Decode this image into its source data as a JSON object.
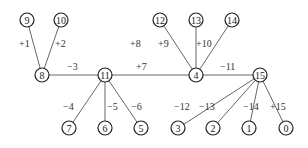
{
  "diagram": {
    "type": "tree",
    "nodes": [
      {
        "id": "9",
        "x": 27,
        "y": 20
      },
      {
        "id": "10",
        "x": 61,
        "y": 20
      },
      {
        "id": "12",
        "x": 160,
        "y": 20
      },
      {
        "id": "13",
        "x": 196,
        "y": 20
      },
      {
        "id": "14",
        "x": 232,
        "y": 20
      },
      {
        "id": "8",
        "x": 42,
        "y": 75
      },
      {
        "id": "11",
        "x": 105,
        "y": 75
      },
      {
        "id": "4",
        "x": 196,
        "y": 75
      },
      {
        "id": "15",
        "x": 260,
        "y": 75
      },
      {
        "id": "7",
        "x": 69,
        "y": 128
      },
      {
        "id": "6",
        "x": 105,
        "y": 128
      },
      {
        "id": "5",
        "x": 141,
        "y": 128
      },
      {
        "id": "3",
        "x": 178,
        "y": 128
      },
      {
        "id": "2",
        "x": 213,
        "y": 128
      },
      {
        "id": "1",
        "x": 249,
        "y": 128
      },
      {
        "id": "0",
        "x": 286,
        "y": 128
      }
    ],
    "edges": [
      {
        "from": "8",
        "to": "9",
        "label": "+1",
        "lx": 19,
        "ly": 47
      },
      {
        "from": "8",
        "to": "10",
        "label": "+2",
        "lx": 55,
        "ly": 47
      },
      {
        "from": "8",
        "to": "11",
        "label": "−3",
        "lx": 67,
        "ly": 70
      },
      {
        "from": "11",
        "to": "4",
        "label": "+7",
        "lx": 136,
        "ly": 70
      },
      {
        "from": "4",
        "to": "12",
        "label": "+8",
        "lx": 130,
        "ly": 47
      },
      {
        "from": "4",
        "to": "13",
        "label": "+9",
        "lx": 158,
        "ly": 47
      },
      {
        "from": "4",
        "to": "14",
        "label": "+10",
        "lx": 196,
        "ly": 47
      },
      {
        "from": "4",
        "to": "15",
        "label": "−11",
        "lx": 220,
        "ly": 70
      },
      {
        "from": "11",
        "to": "7",
        "label": "−4",
        "lx": 63,
        "ly": 110
      },
      {
        "from": "11",
        "to": "6",
        "label": "−5",
        "lx": 107,
        "ly": 110
      },
      {
        "from": "11",
        "to": "5",
        "label": "−6",
        "lx": 131,
        "ly": 110
      },
      {
        "from": "15",
        "to": "3",
        "label": "−12",
        "lx": 174,
        "ly": 110
      },
      {
        "from": "15",
        "to": "2",
        "label": "−13",
        "lx": 199,
        "ly": 110
      },
      {
        "from": "15",
        "to": "1",
        "label": "−14",
        "lx": 243,
        "ly": 110
      },
      {
        "from": "15",
        "to": "0",
        "label": "+15",
        "lx": 270,
        "ly": 110
      }
    ],
    "node_radius": 7,
    "colors": {
      "node_stroke": "#222222",
      "edge_stroke": "#555555",
      "text": "#222222",
      "background": "#ffffff"
    }
  }
}
